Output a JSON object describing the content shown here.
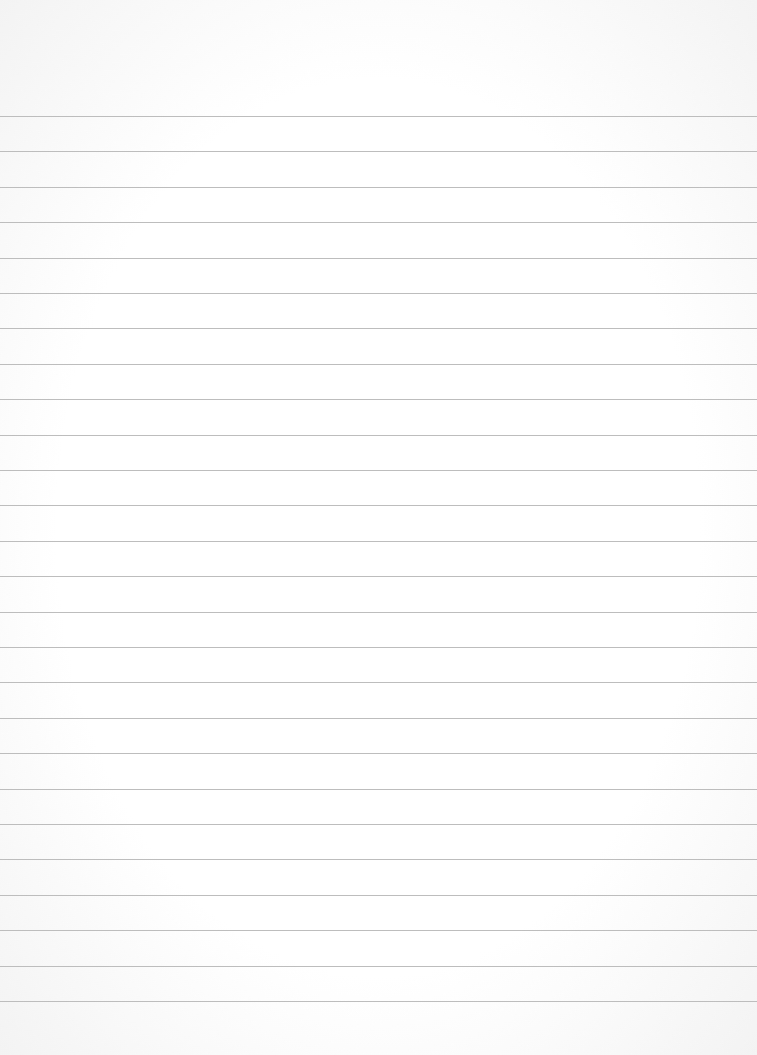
{
  "paper": {
    "type": "lined-paper",
    "background_color": "#fdfdfd",
    "line_color": "#bdbdbd",
    "line_count": 26,
    "first_line_y": 116,
    "line_spacing": 35.4
  }
}
